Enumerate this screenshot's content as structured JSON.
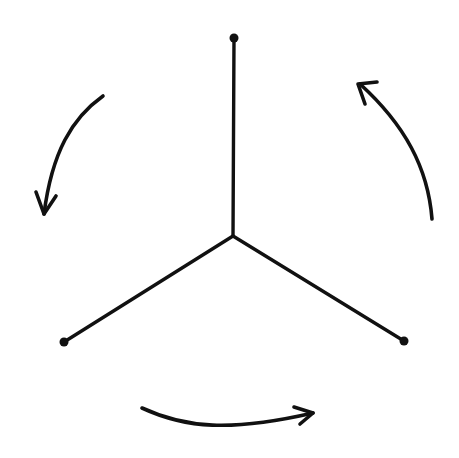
{
  "diagram": {
    "type": "rotation-symmetry-sketch",
    "background": "#ffffff",
    "ink_color": "#111111",
    "center": {
      "x": 233,
      "y": 236
    },
    "spokes": [
      {
        "name": "top",
        "end": {
          "x": 234,
          "y": 38
        }
      },
      {
        "name": "bottom-left",
        "end": {
          "x": 64,
          "y": 342
        }
      },
      {
        "name": "bottom-right",
        "end": {
          "x": 404,
          "y": 341
        }
      }
    ],
    "rotation_arrows": [
      {
        "name": "left",
        "direction": "counterclockwise",
        "path": "M103 96 C 72 118, 52 152, 44 214"
      },
      {
        "name": "bottom",
        "direction": "counterclockwise",
        "path": "M142 408 C 185 428, 230 432, 313 413"
      },
      {
        "name": "right",
        "direction": "counterclockwise",
        "path": "M432 219 C 428 168, 405 125, 360 84"
      }
    ]
  }
}
